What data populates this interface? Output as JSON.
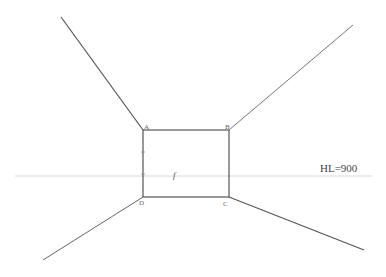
{
  "diagram": {
    "horizon_label": "HL=900",
    "corners": [
      {
        "label": "A",
        "x": 143,
        "y": 130
      },
      {
        "label": "B",
        "x": 229,
        "y": 130
      },
      {
        "label": "C",
        "x": 229,
        "y": 197
      },
      {
        "label": "D",
        "x": 143,
        "y": 197
      }
    ],
    "center_mark": "f",
    "colors": {
      "lines": "#555555",
      "horizon": "#d8d8d8",
      "labels": "#666666"
    }
  }
}
